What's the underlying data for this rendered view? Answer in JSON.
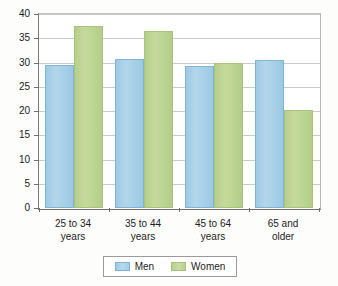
{
  "chart_data": {
    "type": "bar",
    "title": "",
    "xlabel": "",
    "ylabel": "",
    "ylim": [
      0,
      40
    ],
    "ytick_step": 5,
    "grid": true,
    "legend_position": "bottom",
    "categories": [
      "25 to 34 years",
      "35 to 44 years",
      "45 to 64 years",
      "65 and older"
    ],
    "category_lines": [
      [
        "25 to 34",
        "years"
      ],
      [
        "35 to 44",
        "years"
      ],
      [
        "45 to 64",
        "years"
      ],
      [
        "65 and",
        "older"
      ]
    ],
    "ytick_labels": [
      "40",
      "35",
      "30",
      "25",
      "20",
      "15",
      "10",
      "5",
      "0"
    ],
    "ytick_values": [
      40,
      35,
      30,
      25,
      20,
      15,
      10,
      5,
      0
    ],
    "series": [
      {
        "name": "Men",
        "color": "#a6d0e7",
        "values": [
          29.5,
          30.8,
          29.3,
          30.5
        ]
      },
      {
        "name": "Women",
        "color": "#bcd492",
        "values": [
          37.5,
          36.5,
          29.8,
          20.2
        ]
      }
    ]
  },
  "legend": {
    "entries": [
      {
        "label": "Men",
        "swatch": "men-color-swatch"
      },
      {
        "label": "Women",
        "swatch": "women-color-swatch"
      }
    ]
  },
  "colors": {
    "men": "#a6d0e7",
    "women": "#bcd492",
    "axis": "#6e6e6e",
    "grid": "#c9c9c9",
    "text": "#1c1c1c",
    "background": "#fdfdfc"
  }
}
